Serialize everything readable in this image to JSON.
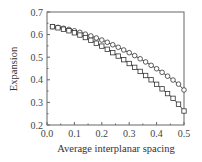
{
  "chart_data": {
    "type": "line",
    "title": "",
    "xlabel": "Average interplanar spacing",
    "ylabel": "Expansion",
    "xlim": [
      0.0,
      0.5
    ],
    "ylim": [
      0.2,
      0.7
    ],
    "xticks": [
      "0.0",
      "0.1",
      "0.2",
      "0.3",
      "0.4",
      "0.5"
    ],
    "yticks": [
      "0.2",
      "0.3",
      "0.4",
      "0.5",
      "0.6",
      "0.7"
    ],
    "grid": false,
    "legend": null,
    "x": [
      0.02,
      0.04,
      0.06,
      0.08,
      0.1,
      0.12,
      0.14,
      0.16,
      0.18,
      0.2,
      0.22,
      0.24,
      0.26,
      0.28,
      0.3,
      0.32,
      0.34,
      0.36,
      0.38,
      0.4,
      0.42,
      0.44,
      0.46,
      0.48,
      0.5
    ],
    "series": [
      {
        "name": "circles",
        "marker": "circle",
        "values": [
          0.635,
          0.632,
          0.628,
          0.623,
          0.617,
          0.61,
          0.602,
          0.594,
          0.585,
          0.576,
          0.566,
          0.555,
          0.544,
          0.532,
          0.52,
          0.507,
          0.493,
          0.479,
          0.464,
          0.449,
          0.433,
          0.416,
          0.399,
          0.381,
          0.355
        ]
      },
      {
        "name": "squares",
        "marker": "square",
        "values": [
          0.635,
          0.63,
          0.624,
          0.617,
          0.608,
          0.598,
          0.587,
          0.575,
          0.562,
          0.549,
          0.535,
          0.52,
          0.505,
          0.489,
          0.472,
          0.455,
          0.437,
          0.419,
          0.4,
          0.38,
          0.36,
          0.339,
          0.318,
          0.292,
          0.262
        ]
      }
    ]
  }
}
